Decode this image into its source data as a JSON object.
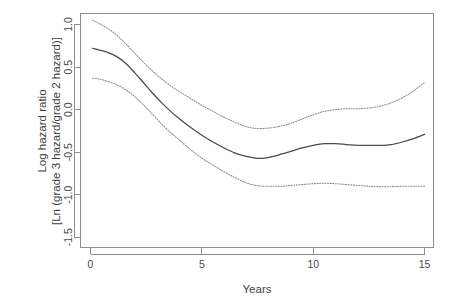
{
  "chart_data": {
    "type": "line",
    "title": "",
    "xlabel": "Years",
    "ylabel": "Log hazard ratio [Ln (grade 3 hazard/grade 2 hazard)]",
    "ylabel_line1": "Log hazard ratio",
    "ylabel_line2": "[Ln (grade 3 hazard/grade 2 hazard)]",
    "xlim": [
      -0.45,
      15.4
    ],
    "ylim": [
      -1.62,
      1.13
    ],
    "xticks": [
      0,
      5,
      10,
      15
    ],
    "xtick_labels": [
      "0",
      "5",
      "10",
      "15"
    ],
    "yticks": [
      1.0,
      0.5,
      0.0,
      -0.5,
      -1.0,
      -1.5
    ],
    "ytick_labels": [
      "1.0",
      "0.5",
      "0.0",
      "-0.5",
      "-1.0",
      "-1.5"
    ],
    "grid": false,
    "legend": "none",
    "x": [
      0.1,
      0.4,
      0.8,
      1.2,
      1.6,
      2.0,
      2.4,
      2.8,
      3.2,
      3.6,
      4.0,
      4.5,
      5.0,
      5.5,
      6.0,
      6.5,
      7.0,
      7.4,
      7.8,
      8.2,
      8.6,
      9.0,
      9.5,
      10.0,
      10.5,
      11.0,
      11.5,
      12.0,
      12.5,
      13.0,
      13.5,
      14.0,
      14.5,
      15.0
    ],
    "series": [
      {
        "name": "Upper 95% confidence limit",
        "style": "dotted",
        "color": "#8a8a8a",
        "values": [
          1.05,
          1.01,
          0.95,
          0.87,
          0.77,
          0.66,
          0.55,
          0.45,
          0.36,
          0.28,
          0.21,
          0.13,
          0.05,
          -0.02,
          -0.09,
          -0.15,
          -0.2,
          -0.22,
          -0.22,
          -0.21,
          -0.19,
          -0.16,
          -0.11,
          -0.06,
          -0.02,
          0.0,
          0.01,
          0.01,
          0.02,
          0.04,
          0.08,
          0.14,
          0.22,
          0.32
        ]
      },
      {
        "name": "Estimated log hazard ratio",
        "style": "solid",
        "color": "#4a4a4a",
        "values": [
          0.72,
          0.7,
          0.67,
          0.62,
          0.54,
          0.43,
          0.31,
          0.19,
          0.08,
          -0.02,
          -0.11,
          -0.21,
          -0.3,
          -0.38,
          -0.45,
          -0.51,
          -0.55,
          -0.57,
          -0.57,
          -0.55,
          -0.52,
          -0.49,
          -0.45,
          -0.42,
          -0.4,
          -0.4,
          -0.41,
          -0.42,
          -0.42,
          -0.42,
          -0.41,
          -0.38,
          -0.34,
          -0.29
        ]
      },
      {
        "name": "Lower 95% confidence limit",
        "style": "dotted",
        "color": "#8a8a8a",
        "values": [
          0.37,
          0.36,
          0.33,
          0.29,
          0.23,
          0.15,
          0.05,
          -0.06,
          -0.17,
          -0.27,
          -0.36,
          -0.47,
          -0.57,
          -0.65,
          -0.73,
          -0.8,
          -0.86,
          -0.89,
          -0.9,
          -0.9,
          -0.9,
          -0.89,
          -0.88,
          -0.87,
          -0.865,
          -0.87,
          -0.88,
          -0.89,
          -0.9,
          -0.905,
          -0.905,
          -0.9,
          -0.9,
          -0.9
        ]
      }
    ]
  }
}
